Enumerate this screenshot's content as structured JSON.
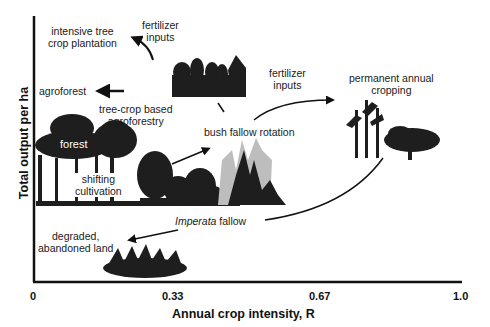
{
  "axes": {
    "y_title": "Total output per ha",
    "x_title": "Annual crop intensity, R",
    "x_ticks": [
      "0",
      "0.33",
      "0.67",
      "1.0"
    ]
  },
  "labels": {
    "intensive_tree_line1": "intensive tree",
    "intensive_tree_line2": "crop plantation",
    "fert1_line1": "fertilizer",
    "fert1_line2": "inputs",
    "agroforest": "agroforest",
    "treecrop_line1": "tree-crop based",
    "treecrop_line2": "agroforestry",
    "forest": "forest",
    "fert2_line1": "fertilizer",
    "fert2_line2": "inputs",
    "permanent_line1": "permanent annual",
    "permanent_line2": "cropping",
    "bush_fallow": "bush fallow rotation",
    "shifting_line1": "shifting",
    "shifting_line2": "cultivation",
    "imperata_italic": "Imperata",
    "imperata_rest": " fallow",
    "degraded_line1": "degraded,",
    "degraded_line2": "abandoned land"
  },
  "colors": {
    "ink": "#111111",
    "vegetation": "#1e1e1e",
    "fire_light": "#bdbdbd",
    "background": "#ffffff"
  }
}
